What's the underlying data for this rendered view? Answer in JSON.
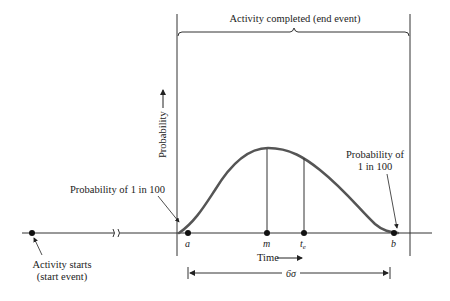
{
  "diagram": {
    "title": "Activity completed (end event)",
    "y_axis_label": "Probability",
    "x_axis_label": "Time",
    "left_annotation": "Probability of 1 in 100",
    "right_annotation_line1": "Probability of",
    "right_annotation_line2": "1 in 100",
    "start_label_line1": "Activity starts",
    "start_label_line2": "(start event)",
    "points": {
      "a": "a",
      "m": "m",
      "te": "t",
      "te_sub": "e",
      "b": "b"
    },
    "span_label": "6σ",
    "colors": {
      "curve": "#555555",
      "lines": "#333333",
      "text": "#222222"
    }
  }
}
